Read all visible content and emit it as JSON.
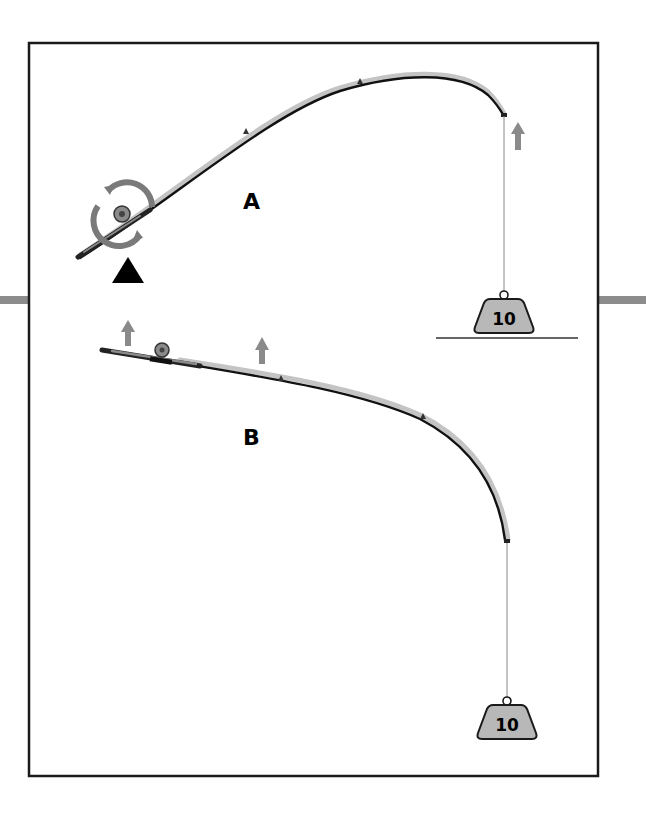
{
  "diagram": {
    "type": "fishing-rod-bend-comparison",
    "colors": {
      "frame": "#1a1a1a",
      "rod_dark": "#111111",
      "rod_light": "#bdbdbd",
      "arrow": "#8a8a8a",
      "weight_fill": "#b8b8b8",
      "weight_stroke": "#1a1a1a",
      "side_bar": "#8c8c8c",
      "ground_line": "#333333",
      "pivot": "#000000"
    },
    "panels": [
      {
        "id": "A",
        "label": "A",
        "description": "Rod pivoting around reel with fulcrum below, weight resting on ground",
        "weight_label": "10",
        "has_pivot_triangle": true,
        "has_rotation_arrows": true,
        "has_ground_line": true
      },
      {
        "id": "B",
        "label": "B",
        "description": "Rod held horizontally with upward lift arrows, weight hanging freely",
        "weight_label": "10",
        "has_pivot_triangle": false,
        "has_rotation_arrows": false,
        "has_ground_line": false
      }
    ]
  }
}
